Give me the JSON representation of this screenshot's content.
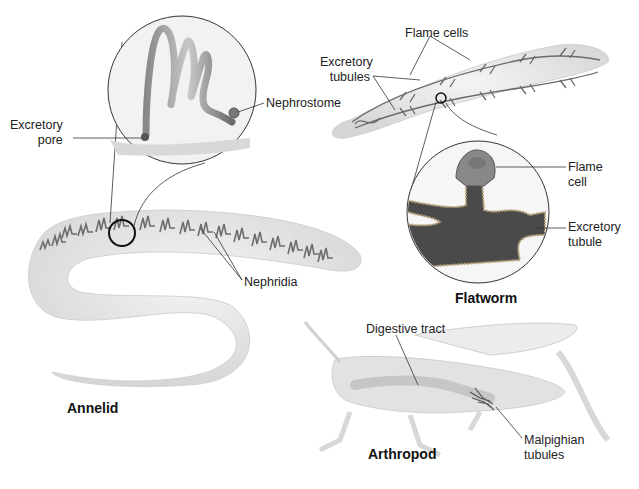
{
  "diagram": {
    "organisms": {
      "annelid": {
        "title": "Annelid"
      },
      "flatworm": {
        "title": "Flatworm"
      },
      "arthropod": {
        "title": "Arthropod"
      }
    },
    "labels": {
      "excretory_pore_1": "Excretory",
      "excretory_pore_2": "pore",
      "nephrostome": "Nephrostome",
      "nephridia": "Nephridia",
      "flame_cells": "Flame cells",
      "excretory_tubules_1": "Excretory",
      "excretory_tubules_2": "tubules",
      "flame_cell_1": "Flame",
      "flame_cell_2": "cell",
      "excretory_tubule_1": "Excretory",
      "excretory_tubule_2": "tubule",
      "digestive_tract": "Digestive tract",
      "malpighian_1": "Malpighian",
      "malpighian_2": "tubules"
    },
    "colors": {
      "body_fill": "#e4e4e4",
      "organ_dark": "#5a5a5a",
      "outline": "#222222"
    }
  }
}
